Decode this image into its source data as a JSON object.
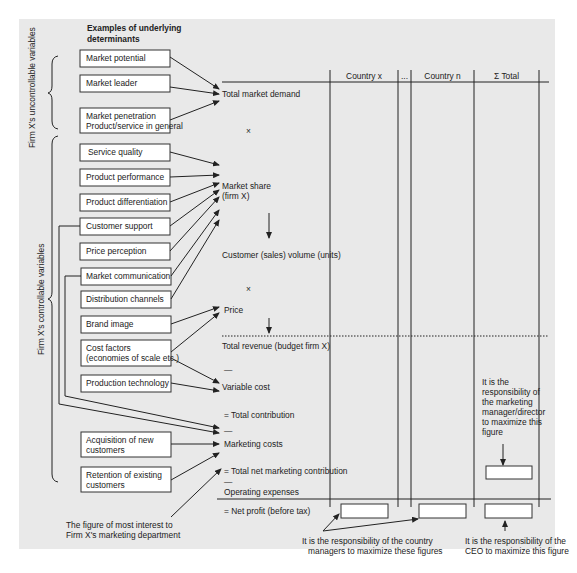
{
  "header": {
    "determinants_title_line1": "Examples of underlying",
    "determinants_title_line2": "determinants"
  },
  "side_labels": {
    "uncontrollable": "Firm X's uncontrollable variables",
    "controllable": "Firm X's controllable variables"
  },
  "determinants": {
    "market_potential": "Market potential",
    "market_leader": "Market leader",
    "market_penetration_line1": "Market penetration",
    "market_penetration_line2": "Product/service in general",
    "service_quality": "Service quality",
    "product_performance": "Product performance",
    "product_differentiation": "Product differentiation",
    "customer_support": "Customer support",
    "price_perception": "Price perception",
    "market_communication": "Market communication",
    "distribution_channels": "Distribution channels",
    "brand_image": "Brand image",
    "cost_factors_line1": "Cost factors",
    "cost_factors_line2": "(economies of scale etc.)",
    "production_technology": "Production technology",
    "acquisition_line1": "Acquisition of new",
    "acquisition_line2": "customers",
    "retention_line1": "Retention of existing",
    "retention_line2": "customers"
  },
  "calculation": {
    "total_market_demand": "Total market demand",
    "times_1": "×",
    "market_share_line1": "Market share",
    "market_share_line2": "(firm X)",
    "customer_volume": "Customer (sales) volume (units)",
    "times_2": "×",
    "price": "Price",
    "total_revenue": "Total revenue (budget firm X)",
    "minus_1": "—",
    "variable_cost": "Variable cost",
    "total_contribution": "= Total contribution",
    "minus_2": "—",
    "marketing_costs": "Marketing costs",
    "total_net_marketing_contribution": "= Total net marketing contribution",
    "minus_3": "—",
    "operating_expenses": "Operating expenses",
    "net_profit": "= Net profit (before tax)"
  },
  "table": {
    "columns": [
      "Country x",
      "...",
      "Country n",
      "Σ Total"
    ]
  },
  "annotations": {
    "marketing_manager": [
      "It is the",
      "responsibility of",
      "the marketing",
      "manager/director",
      "to maximize this",
      "figure"
    ],
    "country_managers_line1": "It is the responsibility of the country",
    "country_managers_line2": "managers to maximize these figures",
    "ceo_line1": "It is the responsibility of the",
    "ceo_line2": "CEO to maximize this figure",
    "marketing_dept_line1": "The figure of most interest to",
    "marketing_dept_line2": "Firm X's marketing department"
  },
  "colors": {
    "panel_background": "#e9e9e9",
    "box_fill": "#ffffff",
    "line": "#222222"
  }
}
